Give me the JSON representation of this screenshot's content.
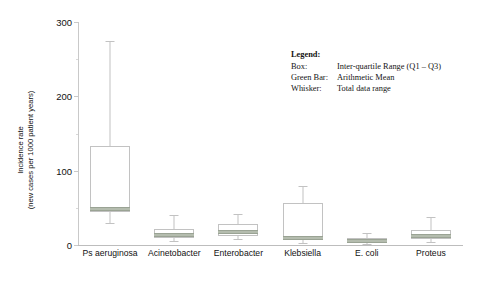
{
  "chart_data": {
    "type": "box",
    "title": "",
    "xlabel": "",
    "ylabel_line1": "Incidence rate",
    "ylabel_line2": "(new cases per 1000 patient years)",
    "ylim": [
      0,
      300
    ],
    "yticks": [
      0,
      100,
      200,
      300
    ],
    "ytick_labels": [
      "0",
      "100",
      "200",
      "300"
    ],
    "yminor": [
      50,
      150,
      250
    ],
    "grid": false,
    "legend_position": "upper-right-inside",
    "categories": [
      "Ps aeruginosa",
      "Acinetobacter",
      "Enterobacter",
      "Klebsiella",
      "E. coli",
      "Proteus"
    ],
    "boxes": [
      {
        "category": "Ps aeruginosa",
        "whisker_low": 30,
        "q1": 45,
        "mean": 48,
        "q3": 133,
        "whisker_high": 275
      },
      {
        "category": "Acinetobacter",
        "whisker_low": 5,
        "q1": 10,
        "mean": 14,
        "q3": 21,
        "whisker_high": 40
      },
      {
        "category": "Enterobacter",
        "whisker_low": 8,
        "q1": 12,
        "mean": 18,
        "q3": 28,
        "whisker_high": 42
      },
      {
        "category": "Klebsiella",
        "whisker_low": 3,
        "q1": 8,
        "mean": 10,
        "q3": 57,
        "whisker_high": 80
      },
      {
        "category": "E. coli",
        "whisker_low": 2,
        "q1": 4,
        "mean": 6,
        "q3": 10,
        "whisker_high": 16
      },
      {
        "category": "Proteus",
        "whisker_low": 4,
        "q1": 8,
        "mean": 12,
        "q3": 20,
        "whisker_high": 38
      }
    ],
    "colors": {
      "box_stroke": "#c2c2c2",
      "whisker": "#c2c2c2",
      "mean_bar": "#b4bcae",
      "axis": "#c9c9c9",
      "text": "#111111",
      "background": "#ffffff"
    }
  },
  "legend": {
    "title": "Legend:",
    "rows": [
      {
        "key": "Box:",
        "value": "Inter-quartile Range (Q1 – Q3)"
      },
      {
        "key": "Green Bar:",
        "value": "Arithmetic Mean"
      },
      {
        "key": "Whisker:",
        "value": "Total data range"
      }
    ]
  }
}
